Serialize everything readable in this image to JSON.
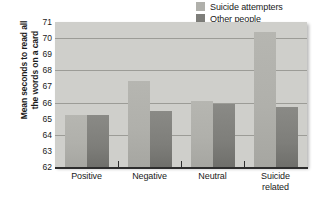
{
  "chart_data": {
    "type": "bar",
    "title": "",
    "subtitle": "",
    "xlabel": "",
    "ylabel_line1": "Mean seconds to read all",
    "ylabel_line2": "the words on a card",
    "categories": [
      "Positive",
      "Negative",
      "Neutral",
      "Suicide related"
    ],
    "category_lines": [
      [
        "Positive"
      ],
      [
        "Negative"
      ],
      [
        "Neutral"
      ],
      [
        "Suicide",
        "related"
      ]
    ],
    "series": [
      {
        "name": "Suicide attempters",
        "color": "#b0b0ab",
        "values": [
          65.2,
          67.35,
          66.1,
          70.35
        ]
      },
      {
        "name": "Other people",
        "color": "#7e7e7a",
        "values": [
          65.2,
          65.5,
          65.9,
          65.75
        ]
      }
    ],
    "ylim": [
      62,
      71
    ],
    "yticks": [
      62,
      63,
      64,
      65,
      66,
      67,
      68,
      69,
      70,
      71
    ],
    "ytick_labels": [
      "62",
      "63",
      "64",
      "65",
      "66",
      "67",
      "68",
      "69",
      "70",
      "71"
    ],
    "gridlines": [
      64,
      66,
      68,
      70
    ],
    "grid": true,
    "legend_position": "top-right",
    "plot_background": "#cfcfcb"
  },
  "legend": {
    "items": [
      {
        "label": "Suicide attempters",
        "swatch": "#b0b0ab"
      },
      {
        "label": "Other people",
        "swatch": "#7e7e7a"
      }
    ]
  }
}
